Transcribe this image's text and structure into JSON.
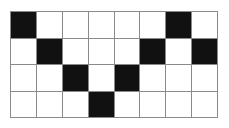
{
  "figure": {
    "kind": "binary-grid-pattern",
    "rows": 4,
    "columns": 8,
    "legend": {
      "filled_value": 1,
      "empty_value": 0,
      "filled_label": "black",
      "empty_label": "white"
    },
    "colors": {
      "filled": "#111111",
      "empty": "#ffffff",
      "gridline": "#8a8a8a",
      "background": "#ffffff"
    },
    "grid": [
      [
        1,
        0,
        0,
        0,
        0,
        0,
        1,
        0
      ],
      [
        0,
        1,
        0,
        0,
        0,
        1,
        0,
        1
      ],
      [
        0,
        0,
        1,
        0,
        1,
        0,
        0,
        0
      ],
      [
        0,
        0,
        0,
        1,
        0,
        0,
        0,
        0
      ]
    ],
    "filled_cells_per_row": [
      2,
      3,
      2,
      1
    ],
    "total_filled_cells": 8,
    "total_cells": 32
  }
}
